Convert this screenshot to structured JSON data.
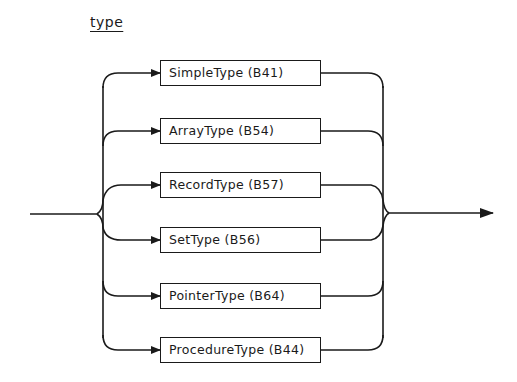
{
  "diagram": {
    "title": "type",
    "kind": "syntax-diagram",
    "alternatives": [
      {
        "label": "SimpleType (B41)",
        "y": 73
      },
      {
        "label": "ArrayType (B54)",
        "y": 131
      },
      {
        "label": "RecordType (B57)",
        "y": 185
      },
      {
        "label": "SetType (B56)",
        "y": 240
      },
      {
        "label": "PointerType (B64)",
        "y": 296
      },
      {
        "label": "ProcedureType (B44)",
        "y": 350
      }
    ],
    "stroke_color": "#1a1a1a",
    "background": "#ffffff"
  }
}
